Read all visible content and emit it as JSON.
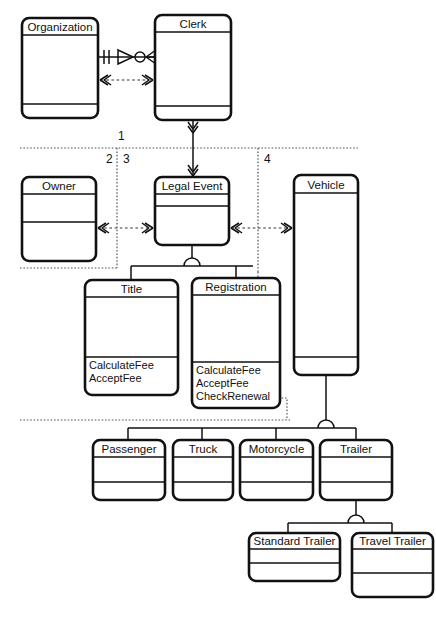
{
  "diagram": {
    "notation": "uml-class-with-er-crowsfoot",
    "colors": {
      "stroke": "#111111",
      "fill": "#ffffff",
      "text": "#111111"
    }
  },
  "classes": [
    {
      "id": "organization",
      "name": "Organization",
      "x": 22,
      "y": 18,
      "w": 76,
      "h": 100,
      "head_h": 17,
      "ops_y": 104,
      "operations": []
    },
    {
      "id": "clerk",
      "name": "Clerk",
      "x": 155,
      "y": 15,
      "w": 76,
      "h": 105,
      "head_h": 17,
      "ops_y": 106,
      "operations": []
    },
    {
      "id": "owner",
      "name": "Owner",
      "x": 22,
      "y": 177,
      "w": 74,
      "h": 84,
      "head_h": 17,
      "ops_y": 222,
      "operations": []
    },
    {
      "id": "legal-event",
      "name": "Legal Event",
      "x": 155,
      "y": 177,
      "w": 74,
      "h": 68,
      "head_h": 17,
      "ops_y": 206,
      "operations": []
    },
    {
      "id": "vehicle",
      "name": "Vehicle",
      "x": 294,
      "y": 175,
      "w": 64,
      "h": 200,
      "head_h": 18,
      "ops_y": 357,
      "operations": []
    },
    {
      "id": "title",
      "name": "Title",
      "x": 85,
      "y": 280,
      "w": 93,
      "h": 115,
      "head_h": 17,
      "ops_y": 357,
      "operations": [
        "CalculateFee",
        "AcceptFee"
      ]
    },
    {
      "id": "registration",
      "name": "Registration",
      "x": 192,
      "y": 278,
      "w": 88,
      "h": 130,
      "head_h": 17,
      "ops_y": 362,
      "operations": [
        "CalculateFee",
        "AcceptFee",
        "CheckRenewal"
      ]
    },
    {
      "id": "passenger",
      "name": "Passenger",
      "x": 93,
      "y": 440,
      "w": 72,
      "h": 60,
      "head_h": 17,
      "ops_y": 482,
      "operations": []
    },
    {
      "id": "truck",
      "name": "Truck",
      "x": 173,
      "y": 440,
      "w": 60,
      "h": 60,
      "head_h": 17,
      "ops_y": 482,
      "operations": []
    },
    {
      "id": "motorcycle",
      "name": "Motorcycle",
      "x": 240,
      "y": 440,
      "w": 73,
      "h": 60,
      "head_h": 17,
      "ops_y": 482,
      "operations": []
    },
    {
      "id": "trailer",
      "name": "Trailer",
      "x": 320,
      "y": 440,
      "w": 72,
      "h": 60,
      "head_h": 17,
      "ops_y": 482,
      "operations": []
    },
    {
      "id": "standard-trailer",
      "name": "Standard Trailer",
      "x": 249,
      "y": 533,
      "w": 91,
      "h": 48,
      "head_h": 16,
      "ops_y": 563,
      "operations": []
    },
    {
      "id": "travel-trailer",
      "name": "Travel Trailer",
      "x": 352,
      "y": 533,
      "w": 81,
      "h": 64,
      "head_h": 16,
      "ops_y": 573,
      "operations": []
    }
  ],
  "partitions": [
    {
      "id": "partition-1",
      "label": "1",
      "x": 118,
      "y": 140
    },
    {
      "id": "partition-2",
      "label": "2",
      "x": 106,
      "y": 163
    },
    {
      "id": "partition-3",
      "label": "3",
      "x": 123,
      "y": 163
    },
    {
      "id": "partition-4",
      "label": "4",
      "x": 264,
      "y": 163
    }
  ]
}
